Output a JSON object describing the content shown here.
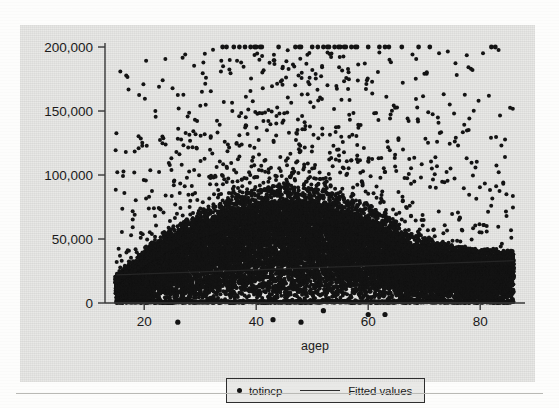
{
  "figure": {
    "background_color": "#fdfdfc",
    "graph_region_color": "#e9e9e7",
    "marker_color": "#141414",
    "axis_color": "#3a3a3a"
  },
  "legend": {
    "entries": [
      {
        "key": "dot-marker",
        "label": "totincp"
      },
      {
        "key": "line-marker",
        "label": "Fitted values"
      }
    ]
  },
  "chart_data": {
    "type": "scatter",
    "title": "",
    "xlabel": "agep",
    "ylabel": "",
    "xlim": [
      13,
      88
    ],
    "ylim": [
      -22000,
      205000
    ],
    "grid": false,
    "legend_position": "bottom-center",
    "xticks": [
      20,
      40,
      60,
      80
    ],
    "xticklabels": [
      "20",
      "40",
      "60",
      "80"
    ],
    "yticks": [
      0,
      50000,
      100000,
      150000,
      200000
    ],
    "yticklabels": [
      "0",
      "50,000",
      "100,000",
      "150,000",
      "200,000"
    ],
    "series": [
      {
        "name": "totincp",
        "type": "scatter",
        "marker": "circle",
        "color": "#141414",
        "note": "Total personal income by age; topcoded at 200,000; dense saturated mass from age 15 to 86 peaking around ages 40-55; a small number of negative-income outliers near -15,000.",
        "age_min": 15,
        "age_max": 86,
        "topcode_value": 200000,
        "density_envelope": {
          "note": "Upper edge of the dense black mass (95th-percentile-like envelope) read off the plot.",
          "ages": [
            15,
            18,
            21,
            24,
            27,
            30,
            33,
            36,
            39,
            42,
            45,
            48,
            51,
            54,
            57,
            60,
            63,
            66,
            69,
            72,
            75,
            78,
            81,
            84,
            86
          ],
          "values": [
            22000,
            33000,
            45000,
            55000,
            63000,
            70000,
            76000,
            82000,
            86000,
            89000,
            90000,
            90000,
            88000,
            85000,
            80000,
            74000,
            68000,
            58000,
            52000,
            48000,
            45000,
            43000,
            42000,
            41000,
            41000
          ]
        },
        "core_envelope": {
          "note": "Upper edge of the near-solid black core.",
          "ages": [
            15,
            18,
            21,
            24,
            27,
            30,
            33,
            36,
            39,
            42,
            45,
            48,
            51,
            54,
            57,
            60,
            63,
            66,
            69,
            72,
            75,
            78,
            81,
            84,
            86
          ],
          "values": [
            16000,
            24000,
            33000,
            41000,
            47000,
            52000,
            56000,
            60000,
            63000,
            65000,
            66000,
            65000,
            63000,
            61000,
            57000,
            53000,
            48000,
            41000,
            37000,
            34000,
            32000,
            31000,
            30000,
            30000,
            30000
          ]
        },
        "topcoded_ages": [
          34,
          36,
          37,
          38,
          39,
          40,
          41,
          44,
          47,
          48,
          50,
          51,
          52,
          53,
          54,
          55,
          56,
          57,
          58,
          60,
          62,
          63,
          66,
          69,
          71,
          82
        ],
        "negative_outliers": [
          {
            "agep": 26,
            "totincp": -15000
          },
          {
            "agep": 43,
            "totincp": -13000
          },
          {
            "agep": 48,
            "totincp": -15000
          },
          {
            "agep": 52,
            "totincp": -6000
          },
          {
            "agep": 60,
            "totincp": -9000
          },
          {
            "agep": 63,
            "totincp": -9000
          }
        ]
      },
      {
        "name": "Fitted values",
        "type": "line",
        "color": "#2a2a2a",
        "note": "Linear regression line of totincp on agep, nearly flat with a slight positive slope.",
        "x": [
          15,
          86
        ],
        "y": [
          22000,
          33000
        ]
      }
    ]
  }
}
